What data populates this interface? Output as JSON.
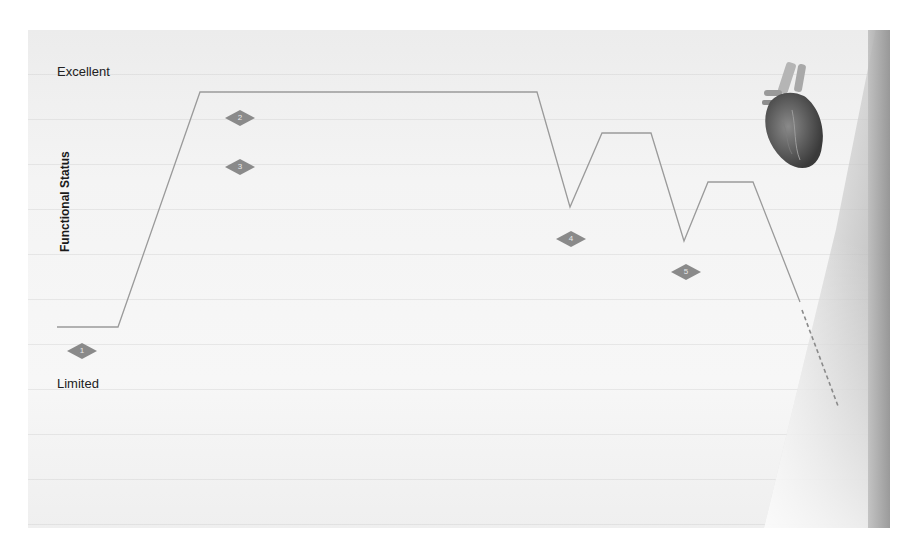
{
  "diagram": {
    "y_axis": {
      "title": "Functional Status",
      "top_label": "Excellent",
      "bottom_label": "Limited"
    },
    "trajectory": {
      "stroke_color": "#9a9a9a",
      "solid_points": [
        [
          57,
          327
        ],
        [
          118,
          327
        ],
        [
          200,
          92
        ],
        [
          537,
          92
        ],
        [
          570,
          207
        ],
        [
          602,
          133
        ],
        [
          651,
          133
        ],
        [
          684,
          241
        ],
        [
          708,
          182
        ],
        [
          753,
          182
        ],
        [
          800,
          302
        ]
      ],
      "dashed_points": [
        [
          802,
          310
        ],
        [
          838,
          406
        ]
      ]
    },
    "markers": [
      {
        "id": "1",
        "label": "1",
        "x": 82,
        "y": 351
      },
      {
        "id": "2",
        "label": "2",
        "x": 240,
        "y": 118
      },
      {
        "id": "3",
        "label": "3",
        "x": 240,
        "y": 167
      },
      {
        "id": "4",
        "label": "4",
        "x": 571,
        "y": 239
      },
      {
        "id": "5",
        "label": "5",
        "x": 686,
        "y": 272
      }
    ],
    "marker_color": "#8a8a8a",
    "image": "anatomical-heart"
  }
}
